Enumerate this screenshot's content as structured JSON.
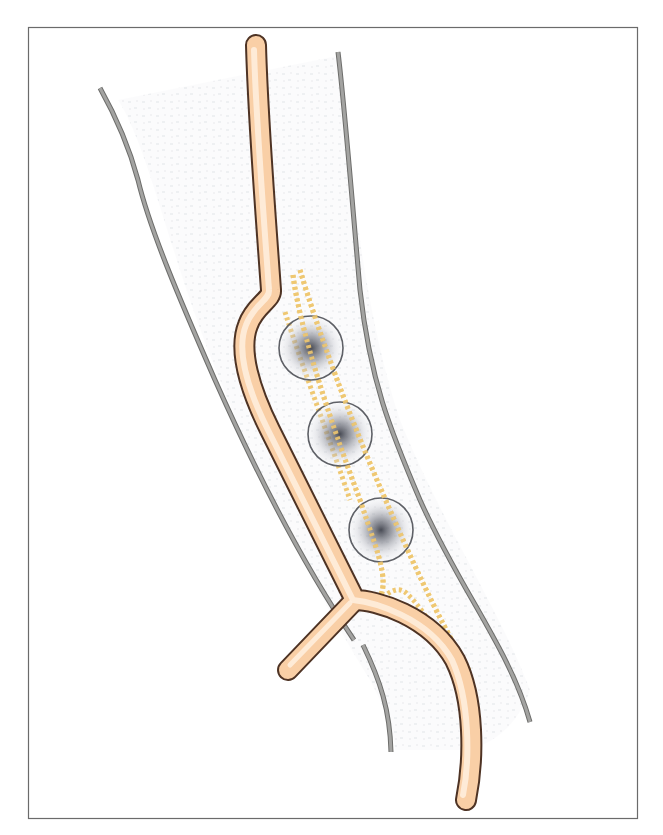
{
  "figure": {
    "type": "anatomical-illustration",
    "frame": {
      "x": 28,
      "y": 27,
      "width": 609,
      "height": 791,
      "stroke": "#6b6b6b"
    },
    "colors": {
      "vessel_fill": "#fbd9b4",
      "vessel_highlight": "#fff1e0",
      "vessel_outline": "#5a3a2a",
      "limb_outline": "#9a9a98",
      "limb_outline_edge": "#6d6d6b",
      "dotted_channel": "#efc872",
      "node_ring": "#5e6066",
      "node_core": "#4a4d57",
      "tissue_stipple": "#e9ebee"
    },
    "nodes": [
      {
        "cx": 311,
        "cy": 348,
        "r": 32
      },
      {
        "cx": 340,
        "cy": 434,
        "r": 32
      },
      {
        "cx": 381,
        "cy": 530,
        "r": 32
      }
    ],
    "labels": []
  }
}
